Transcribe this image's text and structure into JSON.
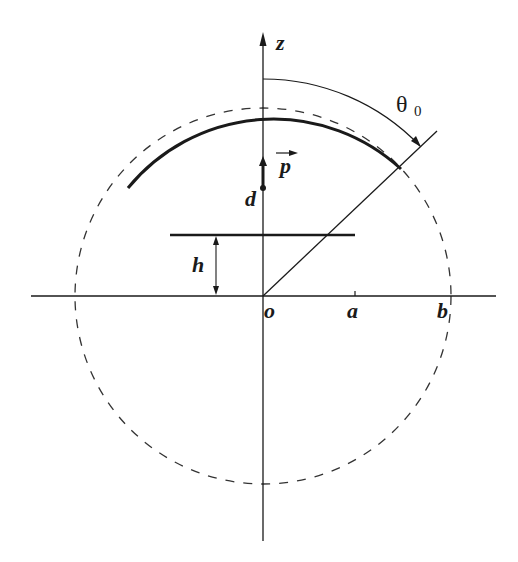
{
  "diagram": {
    "labels": {
      "z_axis": "z",
      "origin": "o",
      "radius_a": "a",
      "radius_b": "b",
      "height_h": "h",
      "dipole_position": "d",
      "dipole_vector": "p",
      "angle": "θ",
      "angle_subscript": "0"
    },
    "colors": {
      "stroke": "#1a1a1a",
      "background": "#ffffff"
    }
  }
}
